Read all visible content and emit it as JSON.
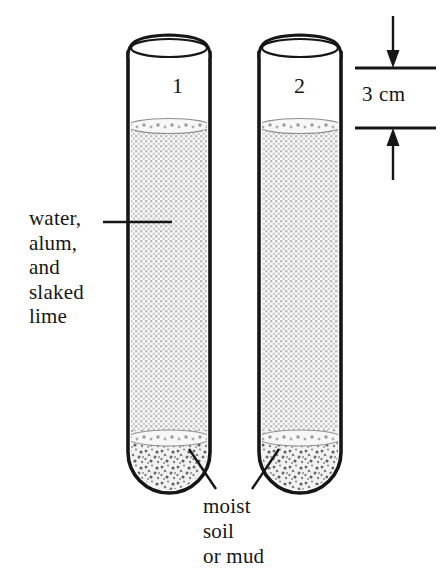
{
  "figure": {
    "background_color": "#ffffff",
    "ink_color": "#161616",
    "liquid_fill_color": "#d8d8d8",
    "sediment_fill_color": "#c9c9c9",
    "glass_outline_color": "#1a1a1a"
  },
  "tubes": [
    {
      "id": "tube-1",
      "number_label": "1",
      "contents_liquid": "water, alum, and slaked lime",
      "contents_sediment": "moist soil or mud"
    },
    {
      "id": "tube-2",
      "number_label": "2",
      "contents_liquid": "water, alum, and slaked lime",
      "contents_sediment": "moist soil or mud"
    }
  ],
  "labels": {
    "liquid": {
      "lines": [
        "water,",
        "alum,",
        "and",
        "slaked",
        "lime"
      ],
      "text": "water,\nalum,\nand\nslaked\nlime"
    },
    "sediment": {
      "lines": [
        "moist",
        "soil",
        "or mud"
      ],
      "text": "moist\nsoil\nor mud"
    }
  },
  "dimension": {
    "value": "3 cm",
    "measures": "headspace from tube rim to liquid surface",
    "arrow_top_direction": "down",
    "arrow_bottom_direction": "up"
  }
}
